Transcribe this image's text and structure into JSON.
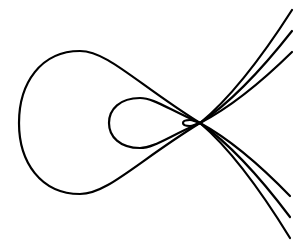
{
  "diagram": {
    "title": "",
    "background": "#ffffff",
    "stroke_color": "#000000",
    "stroke_width": 2.2,
    "node_point": [
      200,
      123
    ],
    "curves": [
      {
        "name": "outer-curve",
        "loop": {
          "left": [
            19,
            123
          ],
          "top": [
            80,
            51
          ],
          "bottom": [
            80,
            194
          ]
        },
        "branch_up_end": [
          292,
          10
        ],
        "branch_down_end": [
          290,
          238
        ]
      },
      {
        "name": "middle-curve",
        "loop": {
          "left": [
            109,
            123
          ],
          "top": [
            140,
            98
          ],
          "bottom": [
            140,
            148
          ]
        },
        "branch_up_end": [
          292,
          31
        ],
        "branch_down_end": [
          290,
          217
        ]
      },
      {
        "name": "inner-curve",
        "loop": {
          "left": [
            183,
            123
          ],
          "top": [
            190,
            120
          ],
          "bottom": [
            190,
            126
          ]
        },
        "branch_up_end": [
          292,
          52
        ],
        "branch_down_end": [
          290,
          196
        ]
      }
    ]
  }
}
